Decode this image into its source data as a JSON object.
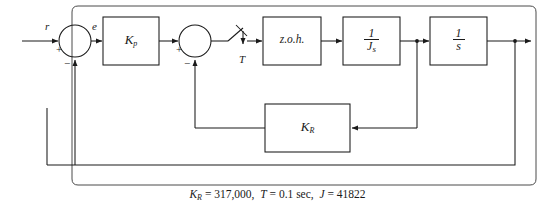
{
  "figure": {
    "type": "control-system-block-diagram",
    "caption": "K_R = 317,000,  T = 0.1 sec,  J = 41822",
    "caption_parts": {
      "kr_symbol": "K",
      "kr_sub": "R",
      "kr_eq": "= 317,000,",
      "t_symbol": "T",
      "t_eq": "= 0.1 sec,",
      "j_symbol": "J",
      "j_eq": "= 41822"
    },
    "parameters": [
      {
        "symbol": "K_R",
        "value": "317,000"
      },
      {
        "symbol": "T",
        "value": "0.1 sec"
      },
      {
        "symbol": "J",
        "value": "41822"
      }
    ]
  },
  "signals": {
    "reference": "r",
    "error": "e",
    "sample_period": "T"
  },
  "blocks": [
    {
      "id": "kp",
      "label": "K",
      "sub": "p",
      "name": "proportional-gain-block"
    },
    {
      "id": "zoh",
      "label": "z.o.h.",
      "sub": "",
      "name": "zero-order-hold-block"
    },
    {
      "id": "js",
      "label": "1/Js",
      "num": "1",
      "den_main": "J",
      "den_sub": "s",
      "name": "inertia-block"
    },
    {
      "id": "int",
      "label": "1/s",
      "num": "1",
      "den_main": "s",
      "den_sub": "",
      "name": "integrator-block"
    },
    {
      "id": "kr",
      "label": "K",
      "sub": "R",
      "name": "rate-feedback-gain-block"
    }
  ],
  "summing_junctions": [
    {
      "id": "sum1",
      "left_sign": "+",
      "bottom_sign": "−",
      "name": "outer-summing-junction"
    },
    {
      "id": "sum2",
      "left_sign": "+",
      "bottom_sign": "−",
      "name": "inner-summing-junction"
    }
  ],
  "colors": {
    "line": "#1a1a1a",
    "background": "#ffffff",
    "frame": "#4a4a4a"
  }
}
